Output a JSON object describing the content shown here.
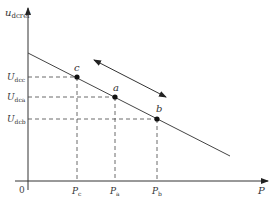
{
  "axes": {
    "y_label": "u",
    "y_label_sub": "dcref",
    "x_label": "P",
    "origin_label": "0"
  },
  "y_ticks": [
    {
      "label": "U",
      "sub": "dcc"
    },
    {
      "label": "U",
      "sub": "dca"
    },
    {
      "label": "U",
      "sub": "dcb"
    }
  ],
  "x_ticks": [
    {
      "label": "P",
      "sub": "c"
    },
    {
      "label": "P",
      "sub": "a"
    },
    {
      "label": "P",
      "sub": "b"
    }
  ],
  "points": [
    {
      "label": "c"
    },
    {
      "label": "a"
    },
    {
      "label": "b"
    }
  ],
  "colors": {
    "line": "#333333",
    "dash": "#444444"
  }
}
